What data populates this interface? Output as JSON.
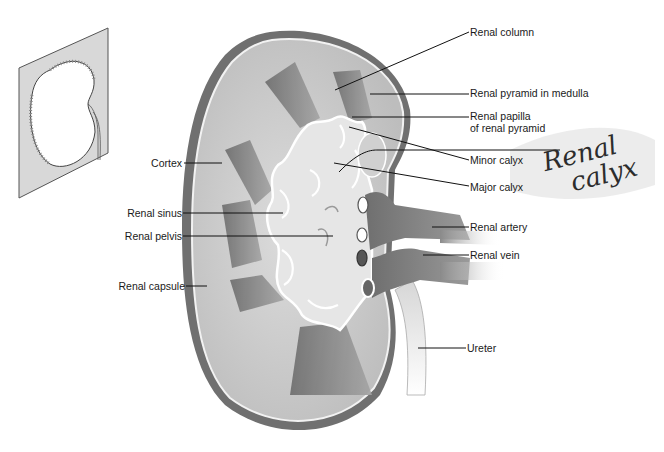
{
  "diagram": {
    "inset": {
      "description": "orientation sketch of kidney on a cutting plane"
    },
    "labels_left": [
      {
        "id": "cortex",
        "text": "Cortex"
      },
      {
        "id": "renal-sinus",
        "text": "Renal sinus"
      },
      {
        "id": "renal-pelvis",
        "text": "Renal pelvis"
      },
      {
        "id": "renal-capsule",
        "text": "Renal capsule"
      }
    ],
    "labels_right": [
      {
        "id": "renal-column",
        "text": "Renal column"
      },
      {
        "id": "renal-pyramid",
        "text": "Renal pyramid in medulla"
      },
      {
        "id": "renal-papilla",
        "text": "Renal papilla",
        "line2": "of renal pyramid"
      },
      {
        "id": "minor-calyx",
        "text": "Minor calyx"
      },
      {
        "id": "major-calyx",
        "text": "Major calyx"
      },
      {
        "id": "renal-artery",
        "text": "Renal artery"
      },
      {
        "id": "renal-vein",
        "text": "Renal vein"
      },
      {
        "id": "ureter",
        "text": "Ureter"
      }
    ],
    "handwritten_annotation": {
      "line1": "Renal",
      "line2": "calyx"
    },
    "colors": {
      "capsule": "#6e6e6e",
      "cortex": "#c9c9c9",
      "medulla_pyramid": "#8a8a8a",
      "sinus": "#e4e4e4",
      "calyx_outline": "#ffffff",
      "vessel": "#7a7a7a",
      "leader_line": "#111111",
      "inset_plane": "#d8d8d8"
    }
  }
}
